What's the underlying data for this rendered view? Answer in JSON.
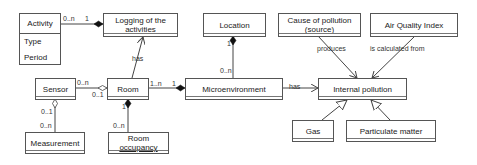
{
  "diagram": {
    "type": "UML class diagram",
    "classes": {
      "activity": {
        "name": "Activity",
        "attributes": [
          "Type",
          "Period"
        ]
      },
      "logging": {
        "name_line1": "Logging of the",
        "name_line2": "activities"
      },
      "location": {
        "name": "Location"
      },
      "cause": {
        "name_line1": "Cause of pollution",
        "name_line2": "(source)"
      },
      "aqi": {
        "name": "Air Quality Index"
      },
      "sensor": {
        "name": "Sensor"
      },
      "room": {
        "name": "Room"
      },
      "microenvironment": {
        "name": "Microenvironment"
      },
      "internal_pollution": {
        "name": "Internal pollution"
      },
      "measurement": {
        "name": "Measurement"
      },
      "room_occupancy": {
        "name_line1": "Room",
        "name_line2": "occupancy"
      },
      "gas": {
        "name": "Gas"
      },
      "particulate": {
        "name": "Particulate matter"
      }
    },
    "relations": {
      "activity_logging": {
        "src_mult": "0..n",
        "dst_mult": "1"
      },
      "room_logging": {
        "label": "has"
      },
      "sensor_room": {
        "src_mult": "0..n",
        "dst_mult": "0..1"
      },
      "sensor_measurement": {
        "src_mult": "0..1",
        "dst_mult": "0..n"
      },
      "room_occupancy": {
        "src_mult": "1",
        "dst_mult": "0..n"
      },
      "room_micro": {
        "src_mult": "1..n",
        "dst_mult": "1"
      },
      "micro_location": {
        "src_mult": "0..n",
        "dst_mult": "1"
      },
      "micro_internal": {
        "label": "has"
      },
      "cause_internal": {
        "label": "produces"
      },
      "aqi_internal": {
        "label": "is calculated from"
      }
    }
  }
}
